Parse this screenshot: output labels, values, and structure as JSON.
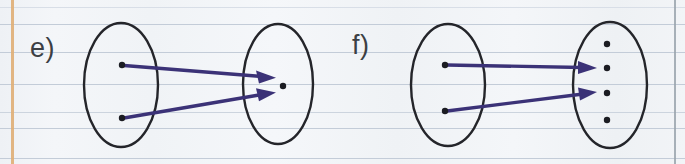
{
  "page": {
    "width": 685,
    "height": 164,
    "background_color": "#f1f3f6",
    "kind": "lined-notebook-paper-scan"
  },
  "paper": {
    "margin_line": {
      "color": "#e0b077",
      "x": 11,
      "orientation": "vertical"
    },
    "right_edge_line": {
      "color": "#9aa3ad",
      "x": 674,
      "orientation": "vertical"
    },
    "rule_color": "#c3ccd8",
    "horizontal_rule_y": [
      7,
      24,
      52,
      84,
      112,
      128,
      158
    ]
  },
  "diagram": {
    "type": "function-mapping-diagram",
    "ink_color": "#24252a",
    "arrow_color": "#3b3277",
    "panels": [
      {
        "id": "e",
        "label": "e)",
        "label_x": 30,
        "label_y": 33,
        "domain": {
          "name": "domain-ellipse",
          "cx": 121,
          "cy": 85,
          "rx": 37,
          "ry": 62,
          "dots": [
            {
              "name": "domain-element-1",
              "cx": 122,
              "cy": 65
            },
            {
              "name": "domain-element-2",
              "cx": 122,
              "cy": 118
            }
          ]
        },
        "codomain": {
          "name": "codomain-ellipse",
          "cx": 278,
          "cy": 84,
          "rx": 35,
          "ry": 60,
          "dots": [
            {
              "name": "codomain-element-1",
              "cx": 283,
              "cy": 86
            }
          ]
        },
        "arrows": [
          {
            "name": "arrow-1",
            "x1": 126,
            "y1": 66,
            "x2": 276,
            "y2": 78
          },
          {
            "name": "arrow-2",
            "x1": 126,
            "y1": 118,
            "x2": 276,
            "y2": 93
          }
        ]
      },
      {
        "id": "f",
        "label": "f)",
        "label_x": 352,
        "label_y": 30,
        "domain": {
          "name": "domain-ellipse",
          "cx": 448,
          "cy": 85,
          "rx": 37,
          "ry": 61,
          "dots": [
            {
              "name": "domain-element-1",
              "cx": 445,
              "cy": 65
            },
            {
              "name": "domain-element-2",
              "cx": 445,
              "cy": 111
            }
          ]
        },
        "codomain": {
          "name": "codomain-ellipse",
          "cx": 610,
          "cy": 85,
          "rx": 37,
          "ry": 63,
          "dots": [
            {
              "name": "codomain-element-1",
              "cx": 607,
              "cy": 44
            },
            {
              "name": "codomain-element-2",
              "cx": 607,
              "cy": 68
            },
            {
              "name": "codomain-element-3",
              "cx": 607,
              "cy": 93
            },
            {
              "name": "codomain-element-4",
              "cx": 607,
              "cy": 120
            }
          ]
        },
        "arrows": [
          {
            "name": "arrow-1",
            "x1": 449,
            "y1": 65,
            "x2": 597,
            "y2": 68
          },
          {
            "name": "arrow-2",
            "x1": 449,
            "y1": 111,
            "x2": 597,
            "y2": 92
          }
        ]
      }
    ]
  }
}
